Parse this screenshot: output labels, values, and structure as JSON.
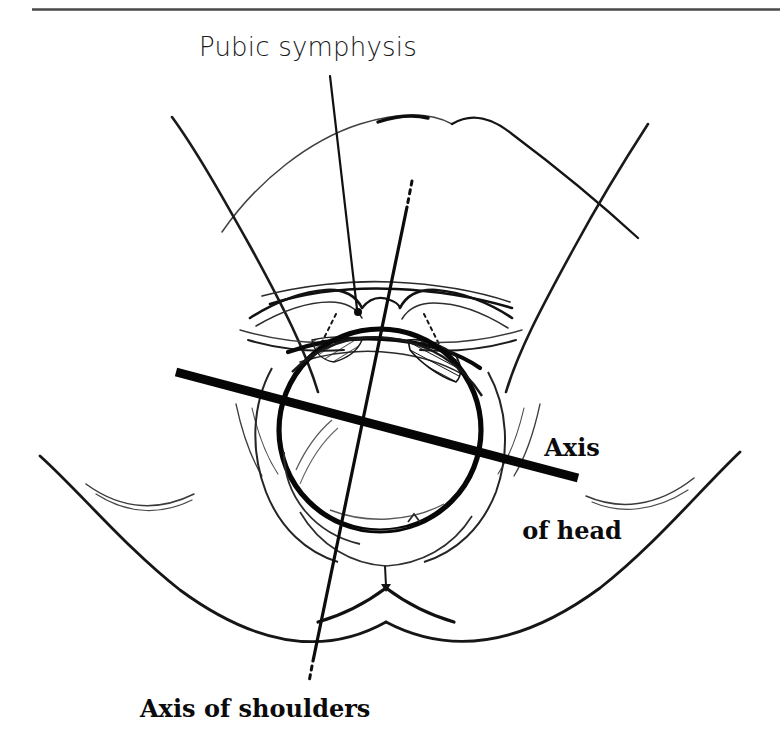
{
  "figure": {
    "kind": "obstetric-line-drawing",
    "background_color": "#ffffff",
    "ink_color": "#111111",
    "width": 780,
    "height": 740
  },
  "rule": {
    "present": true,
    "color": "#4a4a4a"
  },
  "labels": {
    "pubic_symphysis": "Pubic symphysis",
    "axis_of_head_line1": "Axis",
    "axis_of_head_line2": "of head",
    "axis_of_shoulders": "Axis of shoulders"
  },
  "leaders": {
    "pubic_symphysis_leader": {
      "name": "pubic-symphysis-leader-line",
      "from_x": 330,
      "from_y": 76,
      "to_x": 358,
      "to_y": 311,
      "has_end_dot": true
    },
    "axis_of_shoulders_line": {
      "name": "axis-of-shoulders-line",
      "top_x": 411,
      "top_y": 183,
      "bottom_x": 312,
      "bottom_y": 663,
      "dashed_tips": true
    },
    "axis_of_head_line": {
      "name": "axis-of-head-line",
      "from_x": 176,
      "from_y": 372,
      "to_x": 578,
      "to_y": 478,
      "stroke_width": 9
    }
  },
  "anatomy": {
    "fetal_head": {
      "center_x": 380,
      "center_y": 430,
      "radius": 101
    },
    "parts": [
      "left-thigh",
      "right-thigh",
      "buttock-fold-left",
      "buttock-fold-right",
      "mons-pubis",
      "labia-majora",
      "labia-minora",
      "vaginal-introitus",
      "perineum",
      "anus-marker",
      "hatched-tissue-left",
      "hatched-tissue-right"
    ]
  }
}
